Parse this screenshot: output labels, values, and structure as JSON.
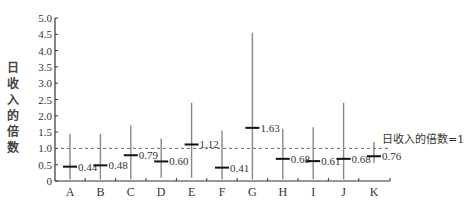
{
  "chart_data": {
    "type": "range",
    "title": "",
    "xlabel": "",
    "ylabel": "日收入的倍数",
    "ylim": [
      0,
      5.0
    ],
    "yticks": [
      "0",
      "0.5",
      "1.0",
      "1.5",
      "2.0",
      "2.5",
      "3.0",
      "3.5",
      "4.0",
      "4.5",
      "5.0"
    ],
    "categories": [
      "A",
      "B",
      "C",
      "D",
      "E",
      "F",
      "G",
      "H",
      "I",
      "J",
      "K"
    ],
    "series": [
      {
        "name": "median",
        "values": [
          0.44,
          0.48,
          0.79,
          0.6,
          1.12,
          0.41,
          1.63,
          0.68,
          0.61,
          0.68,
          0.76
        ]
      },
      {
        "name": "range_low",
        "values": [
          0.05,
          0.05,
          0.05,
          0.1,
          0.1,
          0.05,
          0.05,
          0.05,
          0.05,
          0.05,
          0.55
        ]
      },
      {
        "name": "range_high",
        "values": [
          1.45,
          1.45,
          1.7,
          1.3,
          2.4,
          1.55,
          4.55,
          1.6,
          1.65,
          2.4,
          1.2
        ]
      }
    ],
    "value_labels": [
      "0.44",
      "0.48",
      "0.79",
      "0.60",
      "1.12",
      "0.41",
      "1.63",
      "0.68",
      "0.61",
      "0.68",
      "0.76"
    ],
    "reference_line": {
      "y": 1.0,
      "style": "dashed",
      "label": "日收入的倍数=1"
    },
    "grid": false,
    "legend": "none"
  },
  "colors": {
    "axis": "#333333",
    "bar": "#888888",
    "marker": "#111111",
    "text": "#333333"
  }
}
